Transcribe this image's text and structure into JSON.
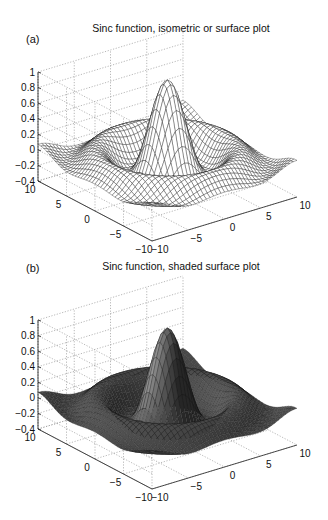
{
  "panels": [
    {
      "label": "(a)",
      "title": "Sinc function, isometric or surface plot",
      "style": "mesh"
    },
    {
      "label": "(b)",
      "title": "Sinc function, shaded surface plot",
      "style": "shaded"
    }
  ],
  "chart_data": [
    {
      "type": "surface",
      "title": "Sinc function, isometric or surface plot",
      "panel": "(a)",
      "function": "z = sin(r)/r, r = sqrt(x^2 + y^2)",
      "x_range": [
        -10,
        10
      ],
      "y_range": [
        -10,
        10
      ],
      "z_range": [
        -0.4,
        1
      ],
      "x_ticks": [
        -10,
        -5,
        0,
        5,
        10
      ],
      "y_ticks": [
        -10,
        -5,
        0,
        5,
        10
      ],
      "z_ticks": [
        -0.4,
        -0.2,
        0,
        0.2,
        0.4,
        0.6,
        0.8,
        1
      ],
      "z_tick_labels": [
        "−0.4",
        "−0.2",
        "0",
        "0.2",
        "0.4",
        "0.6",
        "0.8",
        "1"
      ],
      "peak": {
        "x": 0,
        "y": 0,
        "z": 1
      },
      "grid": true,
      "render": "wireframe mesh (white faces, black edges)"
    },
    {
      "type": "surface",
      "title": "Sinc function, shaded surface plot",
      "panel": "(b)",
      "function": "z = sin(r)/r, r = sqrt(x^2 + y^2)",
      "x_range": [
        -10,
        10
      ],
      "y_range": [
        -10,
        10
      ],
      "z_range": [
        -0.4,
        1
      ],
      "x_ticks": [
        -10,
        -5,
        0,
        5,
        10
      ],
      "y_ticks": [
        -10,
        -5,
        0,
        5,
        10
      ],
      "z_ticks": [
        -0.4,
        -0.2,
        0,
        0.2,
        0.4,
        0.6,
        0.8,
        1
      ],
      "z_tick_labels": [
        "−0.4",
        "−0.2",
        "0",
        "0.2",
        "0.4",
        "0.6",
        "0.8",
        "1"
      ],
      "peak": {
        "x": 0,
        "y": 0,
        "z": 1
      },
      "grid": true,
      "render": "shaded surface (dark gray faces)"
    }
  ],
  "geometry": {
    "grid_n": 40,
    "z_axis_x": 38,
    "z_top_y": 72,
    "z_bottom_y": 165,
    "front_corner": [
      152,
      241
    ],
    "right_corner": [
      297,
      197
    ],
    "left_corner": [
      38,
      181
    ],
    "title_top": 24,
    "label_top": 33
  },
  "colors": {
    "grid": "#9a9a9a",
    "mesh_face": "#ffffff",
    "mesh_edge": "#111111",
    "shade_dark": "#2a2a2a",
    "shade_light": "#8c8c8c",
    "axis": "#222222"
  }
}
